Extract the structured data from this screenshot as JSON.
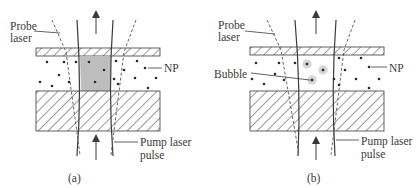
{
  "panels": [
    {
      "id": "a",
      "caption": "(a)",
      "labels": {
        "probe_line1": "Probe",
        "probe_line2": "laser",
        "np": "NP",
        "pump_line1": "Pump laser",
        "pump_line2": "pulse"
      },
      "center_region": "shaded heated volume"
    },
    {
      "id": "b",
      "caption": "(b)",
      "labels": {
        "probe_line1": "Probe",
        "probe_line2": "laser",
        "np": "NP",
        "bubble": "Bubble",
        "pump_line1": "Pump laser",
        "pump_line2": "pulse"
      },
      "center_region": "nanobubbles around NPs"
    }
  ],
  "colors": {
    "line": "#3a3a3a",
    "shaded": "#bdbdbd",
    "bubble_halo": "#cfcfcf",
    "dot": "#2a2a2a"
  }
}
